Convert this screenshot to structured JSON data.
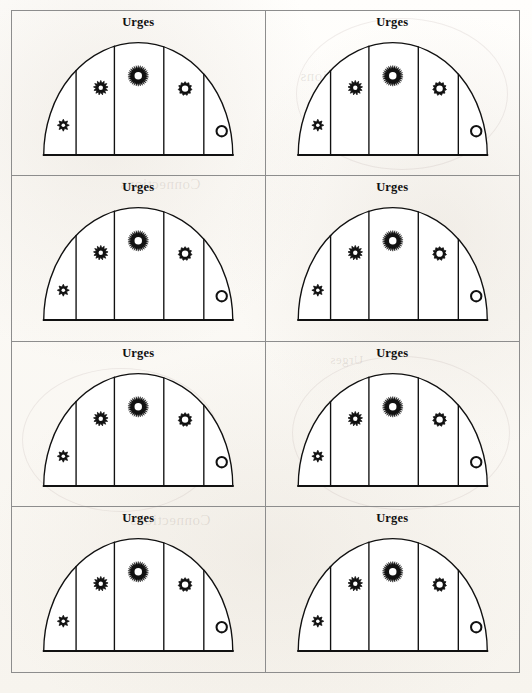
{
  "document": {
    "kind": "scanned-book-page",
    "background_color": "#fdfcfa",
    "ink_color": "#111111",
    "frame_color": "#8d8d8d"
  },
  "layout": {
    "columns": 2,
    "rows": 4,
    "panel_count": 8
  },
  "panel": {
    "title": "Urges",
    "sector_count": 5,
    "baseline_label": "",
    "shape": "semicircular dome divided into five vertical sectors"
  },
  "glyphs": [
    {
      "id": "sector-1-marker",
      "name": "eight-point-star-icon",
      "points": 8,
      "radius": 7.0,
      "inner_ratio": 0.58,
      "hole": 0.3,
      "style": "sharp",
      "cx": 45,
      "cy": 113
    },
    {
      "id": "sector-2-marker",
      "name": "twelve-point-star-icon",
      "points": 13,
      "radius": 8.6,
      "inner_ratio": 0.64,
      "hole": 0.3,
      "style": "sharp",
      "cx": 89,
      "cy": 69
    },
    {
      "id": "sector-3-marker",
      "name": "sunburst-icon",
      "points": 30,
      "radius": 12.2,
      "inner_ratio": 0.72,
      "hole": 0.36,
      "style": "sun",
      "cx": 133,
      "cy": 55
    },
    {
      "id": "sector-4-marker",
      "name": "ten-point-rosette-icon",
      "points": 11,
      "radius": 8.2,
      "inner_ratio": 0.76,
      "hole": 0.46,
      "style": "rounded",
      "cx": 188,
      "cy": 70
    },
    {
      "id": "sector-5-marker",
      "name": "plain-circle-icon",
      "points": 0,
      "radius": 7.4,
      "inner_ratio": 1.0,
      "hole": 0.62,
      "style": "circle",
      "cx": 231,
      "cy": 120
    }
  ],
  "dome": {
    "baseline_y": 148,
    "left_x": 22,
    "right_x": 244,
    "apex_y": 16,
    "divider_x": [
      60,
      105,
      163,
      210
    ],
    "stroke_width": 1.6
  },
  "panels": [
    {
      "index": 1,
      "title": "Urges",
      "position": "row-1-left"
    },
    {
      "index": 2,
      "title": "Urges",
      "position": "row-1-right"
    },
    {
      "index": 3,
      "title": "Urges",
      "position": "row-2-left"
    },
    {
      "index": 4,
      "title": "Urges",
      "position": "row-2-right"
    },
    {
      "index": 5,
      "title": "Urges",
      "position": "row-3-left"
    },
    {
      "index": 6,
      "title": "Urges",
      "position": "row-3-right"
    },
    {
      "index": 7,
      "title": "Urges",
      "position": "row-4-left"
    },
    {
      "index": 8,
      "title": "Urges",
      "position": "row-4-right"
    }
  ],
  "bleed_through": [
    {
      "text": "Connections",
      "x": 120,
      "y": 176,
      "size": 15
    },
    {
      "text": "Connections",
      "x": 300,
      "y": 68,
      "size": 15
    },
    {
      "text": "Connections",
      "x": 130,
      "y": 512,
      "size": 15
    },
    {
      "text": "Urges",
      "x": 330,
      "y": 352,
      "size": 13
    },
    {
      "text": "Urges",
      "x": 70,
      "y": 600,
      "size": 13
    }
  ]
}
